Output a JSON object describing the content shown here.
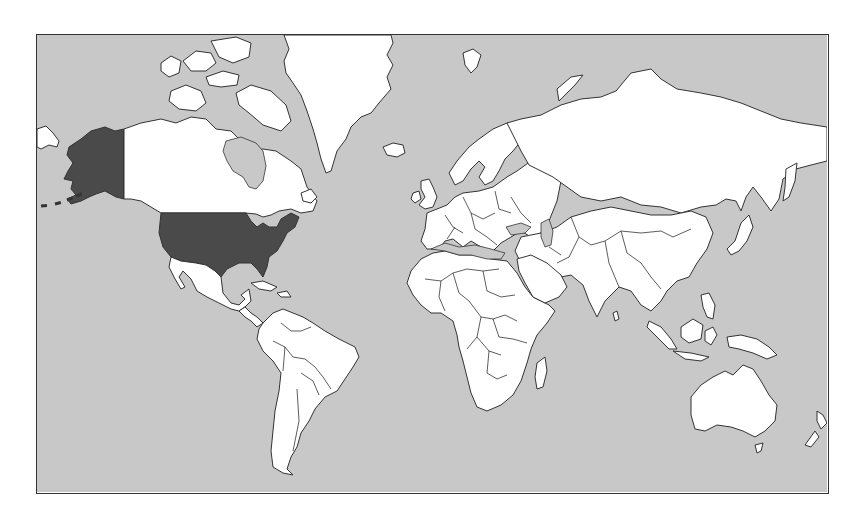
{
  "map": {
    "type": "world-political-outline",
    "projection": "mercator",
    "highlighted_regions": [
      "United States (contiguous)",
      "Alaska"
    ],
    "colors": {
      "ocean": "#c8c8c8",
      "land": "#ffffff",
      "highlight": "#4a4a4a",
      "outline": "#333333"
    },
    "labels": []
  }
}
